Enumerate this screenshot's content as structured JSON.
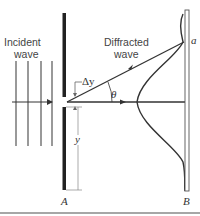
{
  "diagram": {
    "labels": {
      "incident_line1": "Incident",
      "incident_line2": "wave",
      "diffracted_line1": "Diffracted",
      "diffracted_line2": "wave",
      "delta_y": "Δy",
      "theta": "θ",
      "y": "y",
      "barrier": "A",
      "screen": "B",
      "point_a": "a"
    },
    "colors": {
      "ink": "#333333",
      "barrier": "#222222",
      "screen_fill": "#ffffff",
      "dimension": "#777777",
      "rule": "#888888"
    }
  }
}
